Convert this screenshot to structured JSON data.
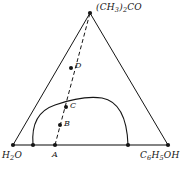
{
  "figure": {
    "type": "ternary-phase-diagram",
    "title": "",
    "background_color": "#ffffff",
    "line_color": "#151515",
    "baseline_color": "#5a5a5a"
  },
  "vertices": {
    "apex": {
      "label_html": "(CH<sub>3</sub>)<sub>2</sub>CO",
      "label_text": "(CH3)2CO",
      "x": 90,
      "y": 13
    },
    "bottom_left": {
      "label_html": "H<sub>2</sub>O",
      "label_text": "H2O",
      "x": 13,
      "y": 145
    },
    "bottom_right": {
      "label_html": "C<sub>6</sub>H<sub>5</sub>OH",
      "label_text": "C6H5OH",
      "x": 168,
      "y": 145
    }
  },
  "points": [
    {
      "name": "A",
      "label": "A",
      "x": 55,
      "y": 145,
      "on": "baseline"
    },
    {
      "name": "B",
      "label": "B",
      "x": 60,
      "y": 125,
      "on": "tie-line"
    },
    {
      "name": "C",
      "label": "C",
      "x": 66,
      "y": 107,
      "on": "binodal-curve"
    },
    {
      "name": "D",
      "label": "D",
      "x": 71,
      "y": 68,
      "on": "tie-line"
    }
  ],
  "tie_line": {
    "name": "dashed-line-A-to-apex",
    "style": "dashed",
    "from": {
      "x": 55,
      "y": 145
    },
    "to": {
      "x": 90,
      "y": 13
    }
  },
  "binodal_curve": {
    "name": "two-phase-region-boundary",
    "style": "solid",
    "left_foot": {
      "x": 33,
      "y": 145
    },
    "right_foot": {
      "x": 128,
      "y": 145
    },
    "apex_region": {
      "x": 100,
      "y": 98
    },
    "path": "M 33,145 C 31,122 40,110 55,105 C 72,99 88,96 102,98 C 118,101 127,116 128,145"
  },
  "baseline_markers": [
    {
      "x": 13,
      "y": 145
    },
    {
      "x": 33,
      "y": 145
    },
    {
      "x": 55,
      "y": 145
    },
    {
      "x": 128,
      "y": 145
    },
    {
      "x": 168,
      "y": 145
    }
  ]
}
